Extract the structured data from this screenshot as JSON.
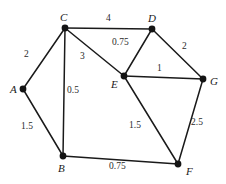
{
  "figure": {
    "background_color": "#ffffff",
    "line_color": "#1a1a1a",
    "node_color": "#141414",
    "text_color": "#1a1a1a"
  },
  "chart_data": {
    "type": "diagram",
    "diagram_kind": "weighted-undirected-graph",
    "title": "",
    "xlabel": "",
    "ylabel": "",
    "grid": false,
    "legend": false,
    "nodes": [
      {
        "id": "A",
        "label": "A",
        "x": 23,
        "y": 89,
        "label_x": 10,
        "label_y": 84
      },
      {
        "id": "B",
        "label": "B",
        "x": 63,
        "y": 156,
        "label_x": 58,
        "label_y": 163
      },
      {
        "id": "C",
        "label": "C",
        "x": 65,
        "y": 28,
        "label_x": 60,
        "label_y": 12
      },
      {
        "id": "D",
        "label": "D",
        "x": 152,
        "y": 29,
        "label_x": 148,
        "label_y": 13
      },
      {
        "id": "E",
        "label": "E",
        "x": 124,
        "y": 76,
        "label_x": 111,
        "label_y": 79
      },
      {
        "id": "F",
        "label": "F",
        "x": 178,
        "y": 164,
        "label_x": 186,
        "label_y": 166
      },
      {
        "id": "G",
        "label": "G",
        "x": 203,
        "y": 79,
        "label_x": 210,
        "label_y": 76
      }
    ],
    "edges": [
      {
        "from": "A",
        "to": "C",
        "weight": "2",
        "label_x": 24,
        "label_y": 50
      },
      {
        "from": "A",
        "to": "B",
        "weight": "1.5",
        "label_x": 21,
        "label_y": 122
      },
      {
        "from": "C",
        "to": "D",
        "weight": "4",
        "label_x": 106,
        "label_y": 14
      },
      {
        "from": "C",
        "to": "E",
        "weight": "3",
        "label_x": 80,
        "label_y": 52
      },
      {
        "from": "C",
        "to": "B",
        "weight": "0.5",
        "label_x": 67,
        "label_y": 86
      },
      {
        "from": "D",
        "to": "E",
        "weight": "0.75",
        "label_x": 112,
        "label_y": 38
      },
      {
        "from": "D",
        "to": "G",
        "weight": "2",
        "label_x": 182,
        "label_y": 42
      },
      {
        "from": "E",
        "to": "G",
        "weight": "1",
        "label_x": 157,
        "label_y": 64
      },
      {
        "from": "E",
        "to": "F",
        "weight": "1.5",
        "label_x": 129,
        "label_y": 121
      },
      {
        "from": "G",
        "to": "F",
        "weight": "2.5",
        "label_x": 191,
        "label_y": 118
      },
      {
        "from": "B",
        "to": "F",
        "weight": "0.75",
        "label_x": 109,
        "label_y": 162
      }
    ]
  }
}
